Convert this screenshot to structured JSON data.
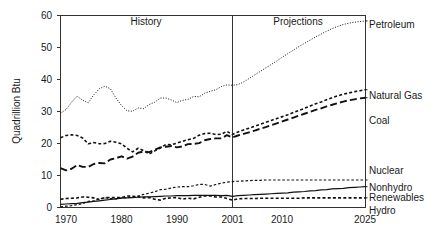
{
  "chart_data": {
    "type": "line",
    "title": "",
    "xlabel": "",
    "ylabel": "Quadrillion Btu",
    "xlim": [
      1970,
      2025
    ],
    "ylim": [
      0,
      60
    ],
    "grid": false,
    "legend_position": "right-of-plot",
    "xticks": [
      1970,
      1980,
      1990,
      2001,
      2010,
      2025
    ],
    "xtick_labels": [
      "1970",
      "1980",
      "1990",
      "2001",
      "2010",
      "2025"
    ],
    "yticks": [
      0,
      10,
      20,
      30,
      40,
      50,
      60
    ],
    "ytick_labels": [
      "0",
      "10",
      "20",
      "30",
      "40",
      "50",
      "60"
    ],
    "annotations": [
      {
        "text": "History",
        "x": 1985.5,
        "y": 57.5
      },
      {
        "text": "Projections",
        "x": 2013,
        "y": 57.5
      }
    ],
    "divider": {
      "x": 2001,
      "label_left": "History",
      "label_right": "Projections"
    },
    "series": [
      {
        "name": "Petroleum",
        "style": "dotted",
        "label": "Petroleum",
        "label_x": 2025,
        "label_y": 57.5,
        "x": [
          1970,
          1971,
          1972,
          1973,
          1974,
          1975,
          1976,
          1977,
          1978,
          1979,
          1980,
          1981,
          1982,
          1983,
          1984,
          1985,
          1986,
          1987,
          1988,
          1989,
          1990,
          1991,
          1992,
          1993,
          1994,
          1995,
          1996,
          1997,
          1998,
          1999,
          2000,
          2001,
          2002,
          2003,
          2004,
          2005,
          2006,
          2007,
          2008,
          2009,
          2010,
          2011,
          2012,
          2013,
          2014,
          2015,
          2016,
          2017,
          2018,
          2019,
          2020,
          2021,
          2022,
          2023,
          2024,
          2025
        ],
        "y": [
          29.5,
          30.6,
          32.9,
          34.8,
          33.5,
          32.7,
          35.2,
          37.1,
          37.9,
          37.1,
          34.2,
          31.9,
          30.2,
          30.1,
          31.1,
          30.9,
          32.2,
          32.9,
          34.2,
          34.2,
          33.6,
          32.8,
          33.5,
          33.8,
          34.7,
          34.6,
          35.7,
          36.3,
          36.8,
          37.8,
          38.3,
          38.2,
          38.4,
          39.2,
          40.3,
          41.4,
          42.5,
          43.6,
          44.7,
          45.8,
          47.0,
          48.1,
          49.2,
          50.3,
          51.3,
          52.3,
          53.3,
          54.2,
          55.1,
          55.9,
          56.6,
          57.2,
          57.6,
          57.9,
          58.1,
          58.3
        ]
      },
      {
        "name": "Natural Gas",
        "style": "dashed-short",
        "label": "Natural Gas",
        "label_x": 2025,
        "label_y": 35.5,
        "x": [
          1970,
          1971,
          1972,
          1973,
          1974,
          1975,
          1976,
          1977,
          1978,
          1979,
          1980,
          1981,
          1982,
          1983,
          1984,
          1985,
          1986,
          1987,
          1988,
          1989,
          1990,
          1991,
          1992,
          1993,
          1994,
          1995,
          1996,
          1997,
          1998,
          1999,
          2000,
          2001,
          2002,
          2003,
          2004,
          2005,
          2006,
          2007,
          2008,
          2009,
          2010,
          2011,
          2012,
          2013,
          2014,
          2015,
          2016,
          2017,
          2018,
          2019,
          2020,
          2021,
          2022,
          2023,
          2024,
          2025
        ],
        "y": [
          21.8,
          22.5,
          22.7,
          22.5,
          21.7,
          19.9,
          20.3,
          19.9,
          20.0,
          20.7,
          20.4,
          19.9,
          18.5,
          17.4,
          18.5,
          17.8,
          16.7,
          17.7,
          18.6,
          19.7,
          19.6,
          20.1,
          20.7,
          21.2,
          21.6,
          22.6,
          23.1,
          23.2,
          22.8,
          22.9,
          23.8,
          22.8,
          23.6,
          24.2,
          24.8,
          25.4,
          26.0,
          26.6,
          27.2,
          27.8,
          28.4,
          29.0,
          29.7,
          30.3,
          31.0,
          31.7,
          32.4,
          33.0,
          33.7,
          34.3,
          34.9,
          35.4,
          35.8,
          36.2,
          36.5,
          36.8
        ]
      },
      {
        "name": "Coal",
        "style": "dashed-long",
        "label": "Coal",
        "label_x": 2025,
        "label_y": 31.0,
        "x": [
          1970,
          1971,
          1972,
          1973,
          1974,
          1975,
          1976,
          1977,
          1978,
          1979,
          1980,
          1981,
          1982,
          1983,
          1984,
          1985,
          1986,
          1987,
          1988,
          1989,
          1990,
          1991,
          1992,
          1993,
          1994,
          1995,
          1996,
          1997,
          1998,
          1999,
          2000,
          2001,
          2002,
          2003,
          2004,
          2005,
          2006,
          2007,
          2008,
          2009,
          2010,
          2011,
          2012,
          2013,
          2014,
          2015,
          2016,
          2017,
          2018,
          2019,
          2020,
          2021,
          2022,
          2023,
          2024,
          2025
        ],
        "y": [
          12.3,
          11.6,
          12.1,
          13.3,
          12.7,
          12.7,
          13.6,
          13.9,
          13.8,
          15.0,
          15.4,
          16.0,
          15.3,
          15.9,
          17.1,
          17.5,
          17.3,
          18.0,
          18.8,
          19.0,
          19.2,
          18.8,
          19.1,
          19.8,
          19.9,
          20.1,
          21.0,
          21.4,
          21.6,
          21.6,
          22.6,
          21.9,
          22.5,
          23.0,
          23.5,
          24.0,
          24.6,
          25.1,
          25.7,
          26.3,
          26.9,
          27.5,
          28.1,
          28.7,
          29.3,
          29.9,
          30.5,
          31.0,
          31.6,
          32.1,
          32.6,
          33.1,
          33.5,
          33.8,
          34.1,
          34.3
        ]
      },
      {
        "name": "Nuclear",
        "style": "dashed-fine",
        "label": "Nuclear",
        "label_x": 2025,
        "label_y": 10.0,
        "x": [
          1970,
          1971,
          1972,
          1973,
          1974,
          1975,
          1976,
          1977,
          1978,
          1979,
          1980,
          1981,
          1982,
          1983,
          1984,
          1985,
          1986,
          1987,
          1988,
          1989,
          1990,
          1991,
          1992,
          1993,
          1994,
          1995,
          1996,
          1997,
          1998,
          1999,
          2000,
          2001,
          2002,
          2003,
          2004,
          2005,
          2006,
          2007,
          2008,
          2009,
          2010,
          2011,
          2012,
          2013,
          2014,
          2015,
          2016,
          2017,
          2018,
          2019,
          2020,
          2021,
          2022,
          2023,
          2024,
          2025
        ],
        "y": [
          0.2,
          0.4,
          0.6,
          0.9,
          1.2,
          1.9,
          2.1,
          2.7,
          3.0,
          2.8,
          2.7,
          3.0,
          3.1,
          3.2,
          3.6,
          4.1,
          4.5,
          4.9,
          5.6,
          5.7,
          6.1,
          6.4,
          6.5,
          6.5,
          6.8,
          7.2,
          7.2,
          6.7,
          7.2,
          7.6,
          7.9,
          8.1,
          8.2,
          8.3,
          8.4,
          8.5,
          8.5,
          8.6,
          8.6,
          8.6,
          8.6,
          8.6,
          8.6,
          8.6,
          8.6,
          8.6,
          8.6,
          8.6,
          8.6,
          8.6,
          8.6,
          8.6,
          8.6,
          8.6,
          8.6,
          8.6
        ]
      },
      {
        "name": "Nonhydro Renewables",
        "style": "solid",
        "label": "Nonhydro\nRenewables",
        "label_x": 2025,
        "label_y": 7.0,
        "x": [
          1970,
          1971,
          1972,
          1973,
          1974,
          1975,
          1976,
          1977,
          1978,
          1979,
          1980,
          1981,
          1982,
          1983,
          1984,
          1985,
          1986,
          1987,
          1988,
          1989,
          1990,
          1991,
          1992,
          1993,
          1994,
          1995,
          1996,
          1997,
          1998,
          1999,
          2000,
          2001,
          2002,
          2003,
          2004,
          2005,
          2006,
          2007,
          2008,
          2009,
          2010,
          2011,
          2012,
          2013,
          2014,
          2015,
          2016,
          2017,
          2018,
          2019,
          2020,
          2021,
          2022,
          2023,
          2024,
          2025
        ],
        "y": [
          1.0,
          1.1,
          1.2,
          1.3,
          1.5,
          1.7,
          1.9,
          2.1,
          2.3,
          2.5,
          2.7,
          2.9,
          3.0,
          3.1,
          3.2,
          3.3,
          3.3,
          3.4,
          3.5,
          3.6,
          3.6,
          3.7,
          3.7,
          3.7,
          3.8,
          3.8,
          3.8,
          3.8,
          3.8,
          3.7,
          3.8,
          3.5,
          3.7,
          3.8,
          3.9,
          4.0,
          4.1,
          4.2,
          4.3,
          4.4,
          4.5,
          4.6,
          4.8,
          4.9,
          5.0,
          5.2,
          5.3,
          5.5,
          5.6,
          5.8,
          5.9,
          6.0,
          6.2,
          6.3,
          6.4,
          6.5
        ]
      },
      {
        "name": "Hydro",
        "style": "dashed-short",
        "label": "Hydro",
        "label_x": 2025,
        "label_y": 3.3,
        "x": [
          1970,
          1971,
          1972,
          1973,
          1974,
          1975,
          1976,
          1977,
          1978,
          1979,
          1980,
          1981,
          1982,
          1983,
          1984,
          1985,
          1986,
          1987,
          1988,
          1989,
          1990,
          1991,
          1992,
          1993,
          1994,
          1995,
          1996,
          1997,
          1998,
          1999,
          2000,
          2001,
          2002,
          2003,
          2004,
          2005,
          2006,
          2007,
          2008,
          2009,
          2010,
          2011,
          2012,
          2013,
          2014,
          2015,
          2016,
          2017,
          2018,
          2019,
          2020,
          2021,
          2022,
          2023,
          2024,
          2025
        ],
        "y": [
          2.6,
          2.8,
          2.9,
          3.0,
          3.3,
          3.2,
          3.0,
          2.5,
          3.1,
          3.1,
          3.1,
          3.1,
          3.6,
          3.5,
          3.4,
          3.0,
          3.1,
          2.6,
          2.3,
          2.9,
          3.0,
          3.1,
          2.6,
          2.9,
          2.7,
          3.2,
          3.6,
          3.6,
          3.3,
          3.3,
          2.8,
          2.3,
          2.7,
          2.8,
          2.8,
          2.8,
          2.9,
          2.9,
          2.9,
          2.9,
          2.9,
          2.9,
          2.9,
          2.9,
          3.0,
          3.0,
          3.0,
          3.0,
          3.0,
          3.0,
          3.0,
          3.0,
          3.0,
          3.0,
          3.0,
          3.0
        ]
      }
    ]
  },
  "labels": {
    "y_axis_title": "Quadrillion Btu",
    "history": "History",
    "projections": "Projections",
    "petroleum": "Petroleum",
    "natural_gas": "Natural Gas",
    "coal": "Coal",
    "nuclear": "Nuclear",
    "nonhydro": "Nonhydro",
    "renewables": "Renewables",
    "hydro": "Hydro",
    "y0": "0",
    "y10": "10",
    "y20": "20",
    "y30": "30",
    "y40": "40",
    "y50": "50",
    "y60": "60",
    "x1970": "1970",
    "x1980": "1980",
    "x1990": "1990",
    "x2001": "2001",
    "x2010": "2010",
    "x2025": "2025"
  },
  "colors": {
    "axis": "#333333",
    "series": "#111111",
    "background": "#ffffff",
    "text": "#1a1a1a"
  }
}
